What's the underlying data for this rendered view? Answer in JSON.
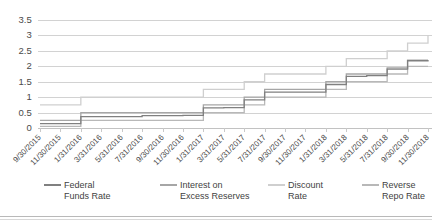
{
  "chart_data": {
    "type": "line",
    "title": "",
    "xlabel": "",
    "ylabel": "",
    "ylim": [
      0,
      3.5
    ],
    "yticks": [
      0,
      0.5,
      1,
      1.5,
      2,
      2.5,
      3,
      3.5
    ],
    "ytick_labels": [
      "0",
      "0.5",
      "1",
      "1.5",
      "2",
      "2.5",
      "3",
      "3.5"
    ],
    "grid": true,
    "legend_position": "bottom",
    "categories": [
      "9/30/2015",
      "11/30/2015",
      "1/31/2016",
      "3/31/2016",
      "5/31/2016",
      "7/31/2016",
      "9/30/2016",
      "11/30/2016",
      "1/31/2017",
      "3/31/2017",
      "5/31/2017",
      "7/31/2017",
      "9/30/2017",
      "11/30/2017",
      "1/31/2018",
      "3/31/2018",
      "5/31/2018",
      "7/31/2018",
      "9/30/2018",
      "11/30/2018"
    ],
    "series": [
      {
        "name": "Federal Funds Rate",
        "color": "#808080",
        "values": [
          0.14,
          0.14,
          0.37,
          0.37,
          0.37,
          0.4,
          0.4,
          0.41,
          0.65,
          0.66,
          0.91,
          1.16,
          1.16,
          1.16,
          1.41,
          1.67,
          1.7,
          1.91,
          2.18,
          2.2
        ]
      },
      {
        "name": "Interest on Excess Reserves",
        "color": "#a6a6a6",
        "values": [
          0.25,
          0.25,
          0.5,
          0.5,
          0.5,
          0.5,
          0.5,
          0.5,
          0.75,
          0.75,
          1.0,
          1.25,
          1.25,
          1.25,
          1.5,
          1.75,
          1.75,
          1.95,
          2.2,
          2.2
        ]
      },
      {
        "name": "Discount Rate",
        "color": "#cfcfcf",
        "values": [
          0.75,
          0.75,
          1.0,
          1.0,
          1.0,
          1.0,
          1.0,
          1.0,
          1.25,
          1.25,
          1.5,
          1.75,
          1.75,
          1.75,
          2.0,
          2.25,
          2.25,
          2.5,
          2.75,
          3.0
        ]
      },
      {
        "name": "Reverse Repo Rate",
        "color": "#b8b8b8",
        "values": [
          0.05,
          0.05,
          0.25,
          0.25,
          0.25,
          0.25,
          0.25,
          0.25,
          0.5,
          0.5,
          0.75,
          1.0,
          1.0,
          1.0,
          1.25,
          1.5,
          1.5,
          1.75,
          2.0,
          2.0
        ]
      }
    ]
  },
  "legend": {
    "items": [
      {
        "label": "Federal\nFunds Rate",
        "color": "#808080"
      },
      {
        "label": "Interest on\nExcess Reserves",
        "color": "#a6a6a6"
      },
      {
        "label": "Discount\nRate",
        "color": "#cfcfcf"
      },
      {
        "label": "Reverse\nRepo Rate",
        "color": "#b8b8b8"
      }
    ]
  }
}
